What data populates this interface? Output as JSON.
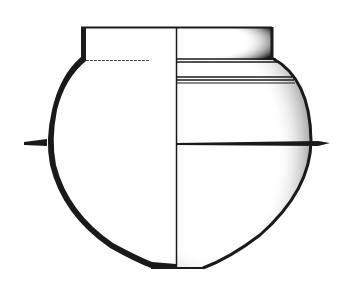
{
  "figure": {
    "style": "half-section / half-elevation technical drawing",
    "colors": {
      "ink": "#1a1a1a",
      "background": "#ffffff",
      "shade": "#2a2a2a"
    }
  }
}
